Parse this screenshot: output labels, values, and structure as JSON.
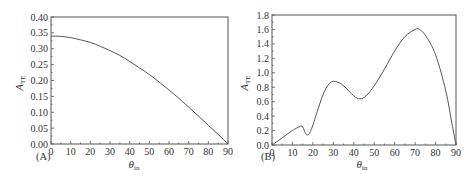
{
  "chart_data": [
    {
      "id": "A",
      "type": "line",
      "panel_label": "(A)",
      "title": "",
      "xlabel": "θ_in",
      "ylabel": "A_TE",
      "xlim": [
        0,
        90
      ],
      "ylim": [
        0,
        0.4
      ],
      "xticks": [
        0,
        10,
        20,
        30,
        40,
        50,
        60,
        70,
        80,
        90
      ],
      "yticks": [
        0.0,
        0.05,
        0.1,
        0.15,
        0.2,
        0.25,
        0.3,
        0.35,
        0.4
      ],
      "ytick_labels": [
        "0.00",
        "0.05",
        "0.10",
        "0.15",
        "0.20",
        "0.25",
        "0.30",
        "0.35",
        "0.40"
      ],
      "grid": false,
      "legend": null,
      "series": [
        {
          "name": "A_TE",
          "x": [
            0,
            5,
            10,
            15,
            20,
            25,
            30,
            35,
            40,
            45,
            50,
            55,
            60,
            65,
            70,
            75,
            80,
            85,
            90
          ],
          "y": [
            0.34,
            0.339,
            0.335,
            0.328,
            0.32,
            0.308,
            0.294,
            0.279,
            0.26,
            0.24,
            0.219,
            0.195,
            0.17,
            0.144,
            0.116,
            0.088,
            0.059,
            0.03,
            0.0
          ]
        }
      ]
    },
    {
      "id": "B",
      "type": "line",
      "panel_label": "(B)",
      "title": "",
      "xlabel": "θ_in",
      "ylabel": "A_TE",
      "xlim": [
        0,
        90
      ],
      "ylim": [
        0,
        1.8
      ],
      "xticks": [
        0,
        10,
        20,
        30,
        40,
        50,
        60,
        70,
        80,
        90
      ],
      "yticks": [
        0.0,
        0.2,
        0.4,
        0.6,
        0.8,
        1.0,
        1.2,
        1.4,
        1.6,
        1.8
      ],
      "ytick_labels": [
        "0.0",
        "0.2",
        "0.4",
        "0.6",
        "0.8",
        "1.0",
        "1.2",
        "1.4",
        "1.6",
        "1.8"
      ],
      "grid": false,
      "legend": null,
      "series": [
        {
          "name": "A_TE",
          "x": [
            0,
            5,
            10,
            14,
            15,
            17,
            19,
            22,
            25,
            28,
            31,
            35,
            40,
            43,
            46,
            50,
            55,
            60,
            65,
            70,
            72,
            75,
            80,
            85,
            88,
            90
          ],
          "y": [
            0.0,
            0.1,
            0.2,
            0.26,
            0.25,
            0.14,
            0.2,
            0.45,
            0.7,
            0.85,
            0.88,
            0.82,
            0.68,
            0.64,
            0.68,
            0.82,
            1.05,
            1.3,
            1.5,
            1.6,
            1.6,
            1.52,
            1.25,
            0.75,
            0.3,
            0.0
          ]
        }
      ]
    }
  ],
  "labels": {
    "a": {
      "panel": "(A)",
      "ylabel_main": "A",
      "ylabel_sub": "TE",
      "xlabel_main": "θ",
      "xlabel_sub": "in"
    },
    "b": {
      "panel": "(B)",
      "ylabel_main": "A",
      "ylabel_sub": "TE",
      "xlabel_main": "θ",
      "xlabel_sub": "in"
    }
  }
}
